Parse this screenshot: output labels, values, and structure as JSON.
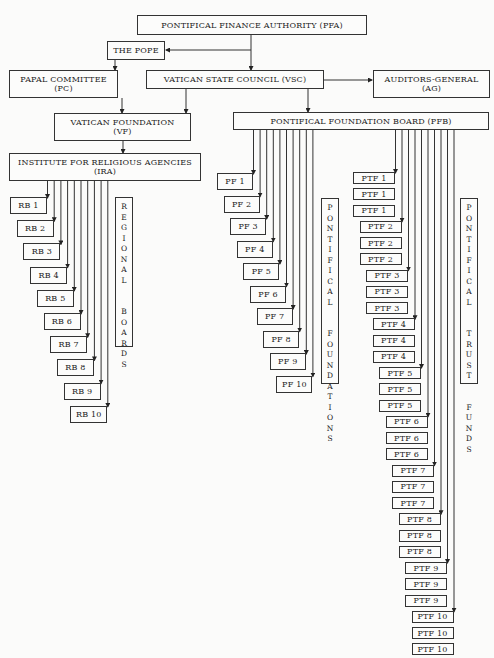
{
  "top": {
    "pfa": {
      "line1": "PONTIFICAL FINANCE AUTHORITY (PFA)"
    },
    "pope": {
      "line1": "THE POPE"
    },
    "pc": {
      "line1": "PAPAL COMMITTEE",
      "line2": "(PC)"
    },
    "vsc": {
      "line1": "VATICAN STATE COUNCIL (VSC)"
    },
    "ag": {
      "line1": "AUDITORS-GENERAL",
      "line2": "(AG)"
    },
    "vf": {
      "line1": "VATICAN FOUNDATION",
      "line2": "(VF)"
    },
    "pfb": {
      "line1": "PONTIFICAL FOUNDATION BOARD (PFB)"
    },
    "ira": {
      "line1": "INSTITUTE FOR RELIGIOUS AGENCIES",
      "line2": "(IRA)"
    }
  },
  "regional_boards": {
    "label": "REGIONAL BOARDS",
    "items": [
      "RB 1",
      "RB 2",
      "RB 3",
      "RB 4",
      "RB 5",
      "RB 6",
      "RB 7",
      "RB 8",
      "RB 9",
      "RB 10"
    ]
  },
  "pontifical_foundations": {
    "label": "PONTIFICAL FOUNDATIONS",
    "items": [
      "PF 1",
      "PF 2",
      "PF 3",
      "PF 4",
      "PF 5",
      "PF 6",
      "PF 7",
      "PF 8",
      "PF 9",
      "PF 10"
    ]
  },
  "pontifical_trust_funds": {
    "label": "PONTIFICAL TRUST FUNDS",
    "items": [
      "PTF 1",
      "PTF 1",
      "PTF 1",
      "PTF 2",
      "PTF 2",
      "PTF 2",
      "PTF 3",
      "PTF 3",
      "PTF 3",
      "PTF 4",
      "PTF 4",
      "PTF 4",
      "PTF 5",
      "PTF 5",
      "PTF 5",
      "PTF 6",
      "PTF 6",
      "PTF 6",
      "PTF 7",
      "PTF 7",
      "PTF 7",
      "PTF 8",
      "PTF 8",
      "PTF 8",
      "PTF 9",
      "PTF 9",
      "PTF 9",
      "PTF 10",
      "PTF 10",
      "PTF 10"
    ]
  }
}
